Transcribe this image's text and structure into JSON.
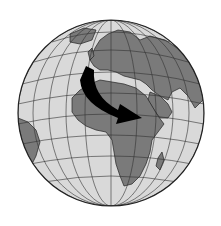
{
  "map": {
    "type": "orthographic-globe",
    "center_region": "Africa / Europe / Middle East",
    "colors": {
      "ocean": "#d9d9d9",
      "land": "#7a7a7a",
      "grid": "#333333",
      "outline": "#222222",
      "arrow": "#000000",
      "background": "#ffffff"
    },
    "annotation": {
      "shape": "curved-arrow",
      "from": "Northwest Africa",
      "to": "Horn of Africa / Ethiopia"
    }
  }
}
